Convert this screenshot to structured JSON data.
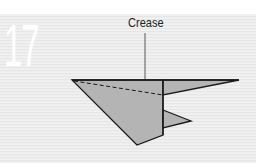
{
  "step": {
    "number": "17"
  },
  "diagram": {
    "label": "Crease",
    "colors": {
      "paper_fill": "#b4b4b4",
      "outline": "#1a1a1a",
      "background": "#ececec",
      "step_number": "#ffffff"
    },
    "shapes": {
      "body_polygon": "72,80 163,80 163,135 137,145",
      "right_wing_polygon": "163,80 239,80 163,95",
      "right_flap_polygon": "163,110 191,121 163,128"
    }
  }
}
